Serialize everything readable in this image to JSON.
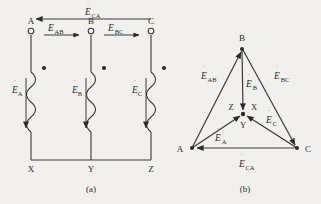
{
  "figure": {
    "title_a": "(a)",
    "title_b": "(b)",
    "background_color": "#f2f0ec",
    "ink_color": "#2b2b2b"
  },
  "circuit": {
    "terminals": [
      {
        "id": "A",
        "label": "A",
        "x": 31,
        "y": 31,
        "label_x": 31,
        "label_y": 21
      },
      {
        "id": "B",
        "label": "B",
        "x": 91,
        "y": 31,
        "label_x": 91,
        "label_y": 21
      },
      {
        "id": "C",
        "label": "C",
        "x": 151,
        "y": 31,
        "label_x": 151,
        "label_y": 21
      }
    ],
    "bottom_nodes": [
      {
        "id": "X",
        "label": "X",
        "x": 31,
        "y": 168
      },
      {
        "id": "Y",
        "label": "Y",
        "x": 91,
        "y": 168
      },
      {
        "id": "Z",
        "label": "Z",
        "x": 151,
        "y": 168
      }
    ],
    "phase_emf_labels": [
      {
        "id": "EA",
        "base": "E",
        "sub": "A",
        "x": 17,
        "y": 92
      },
      {
        "id": "EB",
        "base": "E",
        "sub": "B",
        "x": 77,
        "y": 92
      },
      {
        "id": "EC",
        "base": "E",
        "sub": "C",
        "x": 137,
        "y": 92
      }
    ],
    "line_emf_labels": [
      {
        "id": "ECA",
        "base": "E",
        "sub": "CA",
        "x": 91,
        "y": 14
      },
      {
        "id": "EAB",
        "base": "E",
        "sub": "AB",
        "x": 54,
        "y": 30
      },
      {
        "id": "EBC",
        "base": "E",
        "sub": "BC",
        "x": 114,
        "y": 30
      }
    ],
    "dot_marks": [
      {
        "x": 44,
        "y": 68
      },
      {
        "x": 104,
        "y": 68
      },
      {
        "x": 164,
        "y": 68
      }
    ]
  },
  "phasor": {
    "vertices": [
      {
        "id": "A",
        "label": "A",
        "x": 192,
        "y": 148,
        "label_x": 182,
        "label_y": 149
      },
      {
        "id": "B",
        "label": "B",
        "x": 242,
        "y": 49,
        "label_x": 242,
        "label_y": 38
      },
      {
        "id": "C",
        "label": "C",
        "x": 297,
        "y": 148,
        "label_x": 307,
        "label_y": 149
      }
    ],
    "center": {
      "x": 243,
      "y": 114,
      "labels": [
        {
          "id": "Z",
          "label": "Z",
          "x": 232,
          "y": 108
        },
        {
          "id": "X",
          "label": "X",
          "x": 253,
          "y": 108
        },
        {
          "id": "Y",
          "label": "Y",
          "x": 243,
          "y": 127
        }
      ]
    },
    "line_emf_labels": [
      {
        "id": "EAB",
        "base": "E",
        "sub": "AB",
        "x": 208,
        "y": 78
      },
      {
        "id": "EBC",
        "base": "E",
        "sub": "BC",
        "x": 281,
        "y": 78
      },
      {
        "id": "ECA",
        "base": "E",
        "sub": "CA",
        "x": 246,
        "y": 166
      }
    ],
    "phase_emf_labels": [
      {
        "id": "EA",
        "base": "E",
        "sub": "A",
        "x": 221,
        "y": 139
      },
      {
        "id": "EB",
        "base": "E",
        "sub": "B",
        "x": 251,
        "y": 85
      },
      {
        "id": "EC",
        "base": "E",
        "sub": "C",
        "x": 272,
        "y": 121
      }
    ]
  }
}
